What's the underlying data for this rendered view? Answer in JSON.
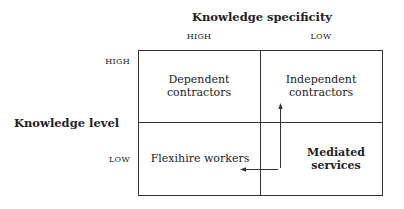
{
  "diagram": {
    "title": "Knowledge specificity",
    "x_axis": {
      "label": "Knowledge specificity",
      "columns": [
        "HIGH",
        "LOW"
      ]
    },
    "y_axis": {
      "label": "Knowledge level",
      "rows": [
        "HIGH",
        "LOW"
      ]
    },
    "cells": [
      {
        "row": "HIGH",
        "col": "HIGH",
        "line1": "Dependent",
        "line2": "contractors",
        "bold": false
      },
      {
        "row": "HIGH",
        "col": "LOW",
        "line1": "Independent",
        "line2": "contractors",
        "bold": false
      },
      {
        "row": "LOW",
        "col": "HIGH",
        "line1": "Flexihire workers",
        "line2": "",
        "bold": false
      },
      {
        "row": "LOW",
        "col": "LOW",
        "line1": "Mediated",
        "line2": "services",
        "bold": true
      }
    ],
    "arrows": [
      {
        "from": "Mediated services",
        "to": "Independent contractors",
        "direction": "up"
      },
      {
        "from": "Mediated services",
        "to": "Flexihire workers",
        "direction": "left"
      }
    ],
    "colors": {
      "line": "#333333",
      "text": "#222222",
      "background": "#ffffff"
    }
  }
}
